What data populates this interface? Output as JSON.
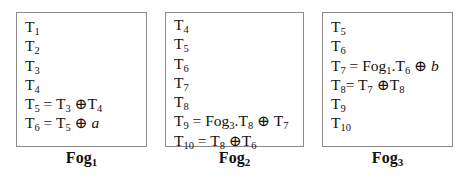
{
  "fogs": [
    {
      "label": "Fog",
      "label_sub": "1",
      "lines": [
        [
          {
            "t": "T"
          },
          {
            "s": "1"
          }
        ],
        [
          {
            "t": "T"
          },
          {
            "s": "2"
          }
        ],
        [
          {
            "t": "T"
          },
          {
            "s": "3"
          }
        ],
        [
          {
            "t": "T"
          },
          {
            "s": "4"
          }
        ],
        [
          {
            "t": "T"
          },
          {
            "s": "5"
          },
          {
            "t": " = T"
          },
          {
            "s": "3"
          },
          {
            "t": " ⊕T"
          },
          {
            "s": "4"
          }
        ],
        [
          {
            "t": "T"
          },
          {
            "s": "6"
          },
          {
            "t": " = T"
          },
          {
            "s": "5"
          },
          {
            "t": " ⊕ "
          },
          {
            "i": "a"
          }
        ]
      ]
    },
    {
      "label": "Fog",
      "label_sub": "2",
      "lines": [
        [
          {
            "t": "T"
          },
          {
            "s": "4"
          }
        ],
        [
          {
            "t": "T"
          },
          {
            "s": "5"
          }
        ],
        [
          {
            "t": "T"
          },
          {
            "s": "6"
          }
        ],
        [
          {
            "t": "T"
          },
          {
            "s": "7"
          }
        ],
        [
          {
            "t": "T"
          },
          {
            "s": "8"
          }
        ],
        [
          {
            "t": "T"
          },
          {
            "s": "9"
          },
          {
            "t": " = Fog"
          },
          {
            "s": "3"
          },
          {
            "t": ".T"
          },
          {
            "s": "8"
          },
          {
            "t": " ⊕ T"
          },
          {
            "s": "7"
          }
        ],
        [
          {
            "t": "T"
          },
          {
            "s": "10"
          },
          {
            "t": " = T"
          },
          {
            "s": "8"
          },
          {
            "t": " ⊕T"
          },
          {
            "s": "6"
          }
        ]
      ]
    },
    {
      "label": "Fog",
      "label_sub": "3",
      "lines": [
        [
          {
            "t": "T"
          },
          {
            "s": "5"
          }
        ],
        [
          {
            "t": "T"
          },
          {
            "s": "6"
          }
        ],
        [
          {
            "t": "T"
          },
          {
            "s": "7"
          },
          {
            "t": " = Fog"
          },
          {
            "s": "1"
          },
          {
            "t": ".T"
          },
          {
            "s": "6"
          },
          {
            "t": " ⊕ "
          },
          {
            "i": "b"
          }
        ],
        [
          {
            "t": "T"
          },
          {
            "s": "8"
          },
          {
            "t": "= T"
          },
          {
            "s": "7"
          },
          {
            "t": " ⊕T"
          },
          {
            "s": "8"
          }
        ],
        [
          {
            "t": "T"
          },
          {
            "s": "9"
          }
        ],
        [
          {
            "t": "T"
          },
          {
            "s": "10"
          }
        ]
      ]
    }
  ]
}
